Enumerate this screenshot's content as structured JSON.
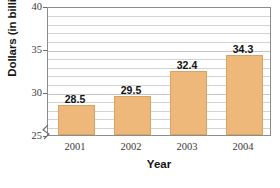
{
  "chart_data": {
    "type": "bar",
    "title": "",
    "xlabel": "Year",
    "ylabel": "Dollars (in billions)",
    "categories": [
      "2001",
      "2002",
      "2003",
      "2004"
    ],
    "values": [
      28.5,
      29.5,
      32.4,
      34.3
    ],
    "value_labels": [
      "28.5",
      "29.5",
      "32.4",
      "34.3"
    ],
    "ylim": [
      25,
      40
    ],
    "y_ticks": [
      25,
      30,
      35,
      40
    ],
    "y_tick_labels": [
      "25",
      "30",
      "35",
      "40"
    ],
    "y_axis_broken": true,
    "grid": true,
    "grid_interval": 1,
    "legend": "none",
    "bar_color": "#edb87a",
    "bar_border_color": "#d9a366",
    "axis_color": "#8c8c8c",
    "gridline_color": "#d2d2d2",
    "text_color": "#141414"
  }
}
